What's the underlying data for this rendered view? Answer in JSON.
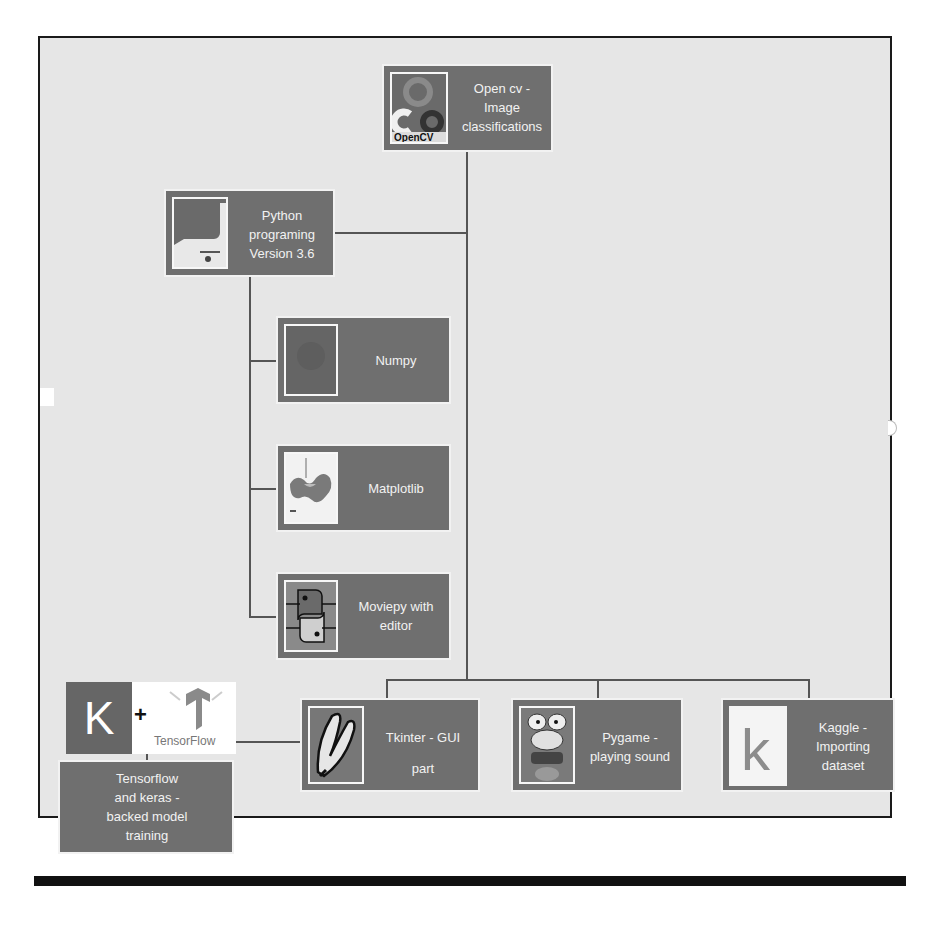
{
  "diagram": {
    "type": "tree",
    "nodes": [
      {
        "id": "opencv",
        "icon": "opencv-logo-icon",
        "lines": [
          "Open cv -",
          "Image",
          "classifications"
        ]
      },
      {
        "id": "python",
        "icon": "python-logo-icon",
        "lines": [
          "Python",
          "programing",
          "Version 3.6"
        ]
      },
      {
        "id": "numpy",
        "icon": "numpy-logo-icon",
        "lines": [
          "Numpy"
        ]
      },
      {
        "id": "matplotlib",
        "icon": "matplotlib-plot-icon",
        "lines": [
          "Matplotlib"
        ]
      },
      {
        "id": "moviepy",
        "icon": "python-snakes-icon",
        "lines": [
          "Moviepy with",
          "editor"
        ]
      },
      {
        "id": "tkinter",
        "icon": "feather-icon",
        "lines": [
          "Tkinter - GUI",
          "part"
        ]
      },
      {
        "id": "pygame",
        "icon": "pygame-frog-icon",
        "lines": [
          "Pygame -",
          "playing sound"
        ]
      },
      {
        "id": "kaggle",
        "icon": "kaggle-k-icon",
        "lines": [
          "Kaggle -",
          "Importing",
          "dataset"
        ]
      },
      {
        "id": "tensorflow_keras",
        "icon": "keras-tensorflow-logo-icon",
        "lines": [
          "Tensorflow",
          "and keras -",
          "backed model",
          "training"
        ]
      }
    ],
    "edges": [
      [
        "opencv",
        "python"
      ],
      [
        "python",
        "numpy"
      ],
      [
        "python",
        "matplotlib"
      ],
      [
        "python",
        "moviepy"
      ],
      [
        "opencv",
        "tkinter"
      ],
      [
        "opencv",
        "pygame"
      ],
      [
        "opencv",
        "kaggle"
      ],
      [
        "tkinter",
        "tensorflow_keras"
      ]
    ],
    "logo_text": {
      "keras": "K",
      "plus": "+",
      "tensorflow": "TensorFlow",
      "opencv": "OpenCV",
      "kaggle": "k"
    }
  }
}
